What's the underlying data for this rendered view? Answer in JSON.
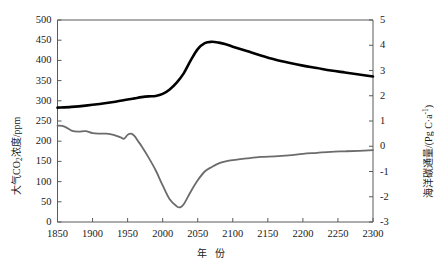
{
  "chart_data": {
    "type": "line",
    "title": "",
    "xlabel": "年 份",
    "xlim": [
      1850,
      2300
    ],
    "xticks": [
      1850,
      1900,
      1950,
      2000,
      2050,
      2100,
      2150,
      2200,
      2250,
      2300
    ],
    "grid": false,
    "legend": "none",
    "axes": [
      {
        "id": "left",
        "label": "大气CO2浓度/ppm",
        "label_plain": "大气CO₂浓度/ppm",
        "ylim": [
          0,
          500
        ],
        "yticks": [
          0,
          50,
          100,
          150,
          200,
          250,
          300,
          350,
          400,
          450,
          500
        ],
        "position": "left"
      },
      {
        "id": "right",
        "label": "海洋碳通量/(Pg C·a-1)",
        "label_plain": "海洋碳通量/(Pg C·a⁻¹)",
        "ylim": [
          -3,
          5
        ],
        "yticks": [
          -3,
          -2,
          -1,
          0,
          1,
          2,
          3,
          4,
          5
        ],
        "position": "right"
      }
    ],
    "series": [
      {
        "name": "大气CO2浓度",
        "name_plain": "大气CO₂浓度",
        "axis": "left",
        "color": "#000000",
        "linewidth": 2.6,
        "x": [
          1850,
          1870,
          1890,
          1910,
          1930,
          1950,
          1960,
          1970,
          1980,
          1990,
          2000,
          2010,
          2020,
          2030,
          2040,
          2050,
          2060,
          2070,
          2080,
          2090,
          2100,
          2120,
          2140,
          2160,
          2180,
          2200,
          2220,
          2240,
          2260,
          2280,
          2300
        ],
        "values": [
          283,
          285,
          288,
          292,
          297,
          303,
          306,
          309,
          311,
          312,
          317,
          328,
          345,
          368,
          400,
          428,
          443,
          446,
          444,
          440,
          434,
          423,
          412,
          402,
          394,
          387,
          381,
          375,
          370,
          365,
          360
        ]
      },
      {
        "name": "海洋碳通量",
        "axis": "right",
        "color": "#6b6b6b",
        "linewidth": 1.8,
        "x": [
          1850,
          1860,
          1870,
          1880,
          1890,
          1900,
          1910,
          1920,
          1930,
          1940,
          1945,
          1950,
          1955,
          1960,
          1965,
          1970,
          1980,
          1990,
          2000,
          2010,
          2020,
          2025,
          2030,
          2040,
          2050,
          2060,
          2070,
          2080,
          2090,
          2100,
          2120,
          2140,
          2160,
          2180,
          2200,
          2220,
          2240,
          2260,
          2280,
          2300
        ],
        "values": [
          0.82,
          0.78,
          0.62,
          0.58,
          0.6,
          0.52,
          0.5,
          0.5,
          0.45,
          0.35,
          0.3,
          0.45,
          0.5,
          0.4,
          0.2,
          0.0,
          -0.45,
          -0.95,
          -1.55,
          -2.1,
          -2.38,
          -2.42,
          -2.3,
          -1.8,
          -1.35,
          -1.0,
          -0.82,
          -0.68,
          -0.6,
          -0.55,
          -0.48,
          -0.42,
          -0.4,
          -0.36,
          -0.3,
          -0.26,
          -0.22,
          -0.2,
          -0.18,
          -0.15
        ]
      }
    ]
  },
  "ticklabels": {
    "x": [
      "1850",
      "1900",
      "1950",
      "2000",
      "2050",
      "2100",
      "2150",
      "2200",
      "2250",
      "2300"
    ],
    "y_left": [
      "500",
      "450",
      "400",
      "350",
      "300",
      "250",
      "200",
      "150",
      "100",
      "50",
      "0"
    ],
    "y_right": [
      "5",
      "4",
      "3",
      "2",
      "1",
      "0",
      "-1",
      "-2",
      "-3"
    ]
  },
  "labels": {
    "x_axis_title": "年 份",
    "y_left_prefix": "大气CO",
    "y_left_sub": "2",
    "y_left_suffix": "浓度/ppm",
    "y_right_prefix": "海洋碳通量/(Pg C·a",
    "y_right_sup": "-1",
    "y_right_suffix": ")"
  }
}
